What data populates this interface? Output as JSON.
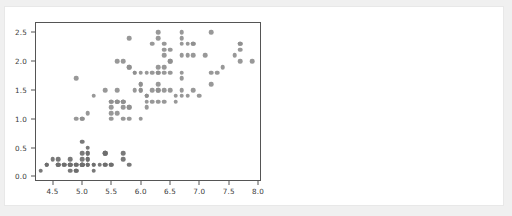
{
  "card": {
    "background": "#ffffff",
    "border_color": "#e8e8e8"
  },
  "chart_data": {
    "type": "scatter",
    "title": "",
    "xlabel": "",
    "ylabel": "",
    "xlim": [
      4.2,
      8.05
    ],
    "ylim": [
      -0.08,
      2.68
    ],
    "grid": false,
    "legend": null,
    "marker_color": "#8f8f8f",
    "marker_color_low": "#6e6e6e",
    "marker_size_px": 4.6,
    "xticks": [
      4.5,
      5.0,
      5.5,
      6.0,
      6.5,
      7.0,
      7.5,
      8.0
    ],
    "xtick_labels": [
      "4.5",
      "5.0",
      "5.5",
      "6.0",
      "6.5",
      "7.0",
      "7.5",
      "8.0"
    ],
    "yticks": [
      0.0,
      0.5,
      1.0,
      1.5,
      2.0,
      2.5
    ],
    "ytick_labels": [
      "0.0",
      "0.5",
      "1.0",
      "1.5",
      "2.0",
      "2.5"
    ],
    "x": [
      5.1,
      4.9,
      4.7,
      4.6,
      5.0,
      5.4,
      4.6,
      5.0,
      4.4,
      4.9,
      5.4,
      4.8,
      4.8,
      4.3,
      5.8,
      5.7,
      5.4,
      5.1,
      5.7,
      5.1,
      5.4,
      5.1,
      4.6,
      5.1,
      4.8,
      5.0,
      5.0,
      5.2,
      5.2,
      4.7,
      4.8,
      5.4,
      5.2,
      5.5,
      4.9,
      5.0,
      5.5,
      4.9,
      4.4,
      5.1,
      5.0,
      4.5,
      4.4,
      5.0,
      5.1,
      4.8,
      5.1,
      4.6,
      5.3,
      5.0,
      7.0,
      6.4,
      6.9,
      5.5,
      6.5,
      5.7,
      6.3,
      4.9,
      6.6,
      5.2,
      5.0,
      5.9,
      6.0,
      6.1,
      5.6,
      6.7,
      5.6,
      5.8,
      6.2,
      5.6,
      5.9,
      6.1,
      6.3,
      6.1,
      6.4,
      6.6,
      6.8,
      6.7,
      6.0,
      5.7,
      5.5,
      5.5,
      5.8,
      6.0,
      5.4,
      6.0,
      6.7,
      6.3,
      5.6,
      5.5,
      5.5,
      6.1,
      5.8,
      5.0,
      5.6,
      5.7,
      5.7,
      6.2,
      5.1,
      5.7,
      6.3,
      5.8,
      7.1,
      6.3,
      6.5,
      7.6,
      4.9,
      7.3,
      6.7,
      7.2,
      6.5,
      6.4,
      6.8,
      5.7,
      5.8,
      6.4,
      6.5,
      7.7,
      7.7,
      6.0,
      6.9,
      5.6,
      7.7,
      6.3,
      6.7,
      7.2,
      6.2,
      6.1,
      6.4,
      7.2,
      7.4,
      7.9,
      6.4,
      6.3,
      6.1,
      7.7,
      6.3,
      6.4,
      6.0,
      6.9,
      6.7,
      6.9,
      5.8,
      6.8,
      6.7,
      6.7,
      6.3,
      6.5,
      6.2,
      5.9
    ],
    "y": [
      0.2,
      0.2,
      0.2,
      0.2,
      0.2,
      0.4,
      0.3,
      0.2,
      0.2,
      0.1,
      0.2,
      0.2,
      0.1,
      0.1,
      0.2,
      0.4,
      0.4,
      0.3,
      0.3,
      0.3,
      0.2,
      0.4,
      0.2,
      0.5,
      0.2,
      0.2,
      0.4,
      0.2,
      0.2,
      0.2,
      0.2,
      0.4,
      0.1,
      0.2,
      0.2,
      0.2,
      0.2,
      0.1,
      0.2,
      0.2,
      0.3,
      0.3,
      0.2,
      0.6,
      0.4,
      0.3,
      0.2,
      0.2,
      0.2,
      0.2,
      1.4,
      1.5,
      1.5,
      1.3,
      1.5,
      1.3,
      1.6,
      1.0,
      1.3,
      1.4,
      1.0,
      1.5,
      1.0,
      1.4,
      1.3,
      1.4,
      1.5,
      1.0,
      1.5,
      1.1,
      1.8,
      1.3,
      1.5,
      1.2,
      1.3,
      1.4,
      1.4,
      1.7,
      1.5,
      1.0,
      1.1,
      1.0,
      1.2,
      1.6,
      1.5,
      1.6,
      1.5,
      1.3,
      1.3,
      1.3,
      1.2,
      1.4,
      1.2,
      1.0,
      1.3,
      1.2,
      1.3,
      1.3,
      1.1,
      1.3,
      2.5,
      1.9,
      2.1,
      1.8,
      2.2,
      2.1,
      1.7,
      1.8,
      1.8,
      2.5,
      2.0,
      1.9,
      2.1,
      2.0,
      2.4,
      2.3,
      1.8,
      2.2,
      2.3,
      1.5,
      2.3,
      2.0,
      2.0,
      1.8,
      2.1,
      1.8,
      1.8,
      1.8,
      2.1,
      1.6,
      1.9,
      2.0,
      2.2,
      1.5,
      1.4,
      2.3,
      2.4,
      1.8,
      1.8,
      2.1,
      2.4,
      2.3,
      1.9,
      2.3,
      2.5,
      2.3,
      1.9,
      2.0,
      2.3,
      1.8
    ]
  }
}
